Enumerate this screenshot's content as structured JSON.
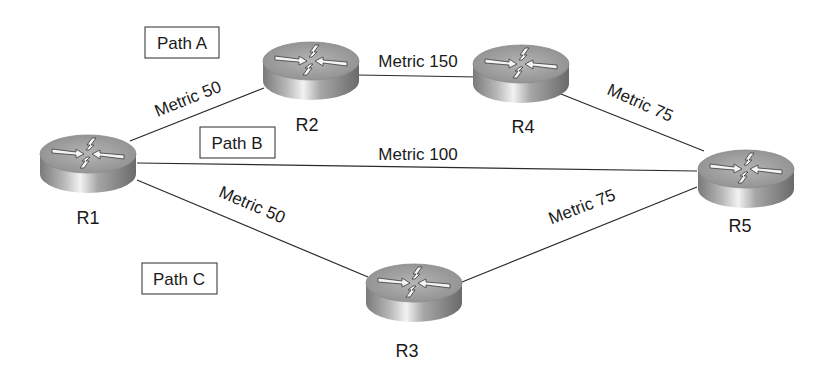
{
  "diagram": {
    "type": "network-topology",
    "nodes": [
      {
        "id": "R1",
        "label": "R1",
        "cx": 88,
        "cy": 160,
        "lx": 88,
        "ly": 224
      },
      {
        "id": "R2",
        "label": "R2",
        "cx": 311,
        "cy": 67,
        "lx": 307,
        "ly": 131
      },
      {
        "id": "R3",
        "label": "R3",
        "cx": 414,
        "cy": 289,
        "lx": 407,
        "ly": 357
      },
      {
        "id": "R4",
        "label": "R4",
        "cx": 521,
        "cy": 70,
        "lx": 523,
        "ly": 133
      },
      {
        "id": "R5",
        "label": "R5",
        "cx": 746,
        "cy": 175,
        "lx": 740,
        "ly": 232
      }
    ],
    "links": [
      {
        "from": "R1",
        "to": "R2",
        "label": "Metric 50",
        "metric": 50,
        "x1": 130,
        "y1": 141,
        "x2": 264,
        "y2": 88,
        "tx": 190,
        "ty": 104,
        "rot": -22
      },
      {
        "from": "R2",
        "to": "R4",
        "label": "Metric 150",
        "metric": 150,
        "x1": 358,
        "y1": 75,
        "x2": 478,
        "y2": 77,
        "tx": 418,
        "ty": 66,
        "rot": 0
      },
      {
        "from": "R4",
        "to": "R5",
        "label": "Metric 75",
        "metric": 75,
        "x1": 570,
        "y1": 92,
        "x2": 704,
        "y2": 151,
        "tx": 637,
        "ty": 109,
        "rot": 24
      },
      {
        "from": "R1",
        "to": "R5",
        "label": "Metric 100",
        "metric": 100,
        "x1": 137,
        "y1": 163,
        "x2": 697,
        "y2": 171,
        "tx": 418,
        "ty": 160,
        "rot": 0
      },
      {
        "from": "R1",
        "to": "R3",
        "label": "Metric 50",
        "metric": 50,
        "x1": 137,
        "y1": 180,
        "x2": 368,
        "y2": 277,
        "tx": 250,
        "ty": 212,
        "rot": 23
      },
      {
        "from": "R3",
        "to": "R5",
        "label": "Metric 75",
        "metric": 75,
        "x1": 462,
        "y1": 282,
        "x2": 697,
        "y2": 187,
        "tx": 584,
        "ty": 211,
        "rot": -21
      }
    ],
    "paths": [
      {
        "id": "path-a",
        "label": "Path A",
        "x": 145,
        "y": 27,
        "w": 74,
        "h": 31,
        "route": [
          "R1",
          "R2",
          "R4",
          "R5"
        ]
      },
      {
        "id": "path-b",
        "label": "Path B",
        "x": 200,
        "y": 127,
        "w": 75,
        "h": 31,
        "route": [
          "R1",
          "R5"
        ]
      },
      {
        "id": "path-c",
        "label": "Path C",
        "x": 142,
        "y": 263,
        "w": 75,
        "h": 31,
        "route": [
          "R1",
          "R3",
          "R5"
        ]
      }
    ],
    "colors": {
      "line": "#2a2a2a",
      "text": "#1a1a1a",
      "router_top": "#a8a8a8",
      "router_side_dark": "#6e6e6e",
      "router_side_light": "#e8e8e8"
    }
  }
}
